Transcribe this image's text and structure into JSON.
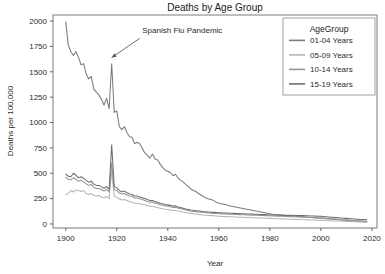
{
  "chart_data": {
    "type": "line",
    "title": "Deaths by Age Group",
    "xlabel": "Year",
    "ylabel": "Deaths per 100,000",
    "xlim": [
      1895,
      2022
    ],
    "ylim": [
      -40,
      2060
    ],
    "xticks": [
      1900,
      1920,
      1940,
      1960,
      1980,
      2000,
      2020
    ],
    "xtick_labels": [
      "1900",
      "1920",
      "1940",
      "1960",
      "1980",
      "2000",
      "2020"
    ],
    "yticks": [
      0,
      250,
      500,
      750,
      1000,
      1250,
      1500,
      1750,
      2000
    ],
    "ytick_labels": [
      "0",
      "250",
      "500",
      "750",
      "1000",
      "1250",
      "1500",
      "1750",
      "2000"
    ],
    "grid": false,
    "legend_position": "upper-right",
    "legend_title": "AgeGroup",
    "annotations": [
      {
        "text": "Spanish Flu Pandemic",
        "text_x": 1930,
        "text_y": 1880,
        "arrow_tip_x": 1918,
        "arrow_tip_y": 1640,
        "arrow_tail_x": 1929,
        "arrow_tail_y": 1830
      }
    ],
    "colors": {
      "01-04 Years": "#7b7b86",
      "05-09 Years": "#b5b5bb",
      "10-14 Years": "#949499",
      "15-19 Years": "#6d6d78",
      "axis": "#555555",
      "frame": "#6e6e6e",
      "background": "#ffffff"
    },
    "x": [
      1900,
      1901,
      1902,
      1903,
      1904,
      1905,
      1906,
      1907,
      1908,
      1909,
      1910,
      1911,
      1912,
      1913,
      1914,
      1915,
      1916,
      1917,
      1918,
      1919,
      1920,
      1921,
      1922,
      1923,
      1924,
      1925,
      1926,
      1927,
      1928,
      1929,
      1930,
      1931,
      1932,
      1933,
      1934,
      1935,
      1936,
      1937,
      1938,
      1939,
      1940,
      1941,
      1942,
      1943,
      1944,
      1945,
      1946,
      1947,
      1948,
      1949,
      1950,
      1951,
      1952,
      1953,
      1954,
      1955,
      1956,
      1957,
      1958,
      1959,
      1960,
      1961,
      1962,
      1963,
      1964,
      1965,
      1966,
      1967,
      1968,
      1969,
      1970,
      1971,
      1972,
      1973,
      1974,
      1975,
      1976,
      1977,
      1978,
      1979,
      1980,
      1981,
      1982,
      1983,
      1984,
      1985,
      1986,
      1987,
      1988,
      1989,
      1990,
      1991,
      1992,
      1993,
      1994,
      1995,
      1996,
      1997,
      1998,
      1999,
      2000,
      2001,
      2002,
      2003,
      2004,
      2005,
      2006,
      2007,
      2008,
      2009,
      2010,
      2011,
      2012,
      2013,
      2014,
      2015,
      2016,
      2017,
      2018
    ],
    "series": [
      {
        "name": "01-04 Years",
        "color": "#7b7b86",
        "values": [
          1990,
          1760,
          1700,
          1660,
          1700,
          1640,
          1570,
          1580,
          1480,
          1430,
          1455,
          1330,
          1300,
          1270,
          1230,
          1170,
          1240,
          1135,
          1580,
          1100,
          1115,
          960,
          930,
          960,
          900,
          860,
          855,
          790,
          805,
          790,
          745,
          700,
          675,
          650,
          690,
          640,
          630,
          590,
          555,
          530,
          520,
          505,
          475,
          490,
          455,
          430,
          415,
          390,
          370,
          345,
          330,
          320,
          300,
          285,
          270,
          255,
          245,
          240,
          230,
          215,
          205,
          200,
          195,
          190,
          180,
          175,
          170,
          165,
          160,
          155,
          150,
          145,
          140,
          135,
          130,
          125,
          120,
          115,
          110,
          105,
          100,
          96,
          93,
          90,
          88,
          86,
          84,
          82,
          80,
          78,
          76,
          74,
          72,
          70,
          68,
          66,
          64,
          62,
          60,
          58,
          56,
          54,
          52,
          50,
          48,
          46,
          44,
          42,
          40,
          38,
          36,
          34,
          32,
          30,
          28,
          27,
          26,
          25,
          24
        ]
      },
      {
        "name": "05-09 Years",
        "color": "#b5b5bb",
        "values": [
          290,
          300,
          330,
          315,
          335,
          330,
          320,
          330,
          300,
          290,
          300,
          280,
          275,
          280,
          265,
          255,
          270,
          250,
          520,
          270,
          265,
          245,
          235,
          240,
          230,
          220,
          215,
          205,
          205,
          200,
          195,
          190,
          180,
          175,
          175,
          168,
          162,
          155,
          150,
          145,
          142,
          138,
          132,
          135,
          128,
          122,
          118,
          112,
          108,
          104,
          100,
          97,
          94,
          91,
          88,
          86,
          84,
          82,
          80,
          78,
          76,
          74,
          73,
          72,
          71,
          70,
          69,
          68,
          67,
          66,
          65,
          64,
          63,
          62,
          61,
          60,
          59,
          58,
          57,
          56,
          55,
          54,
          53,
          52,
          51,
          50,
          49,
          48,
          47,
          46,
          45,
          44,
          43,
          42,
          41,
          40,
          39,
          38,
          37,
          36,
          35,
          34,
          33,
          32,
          31,
          30,
          29,
          28,
          27,
          26,
          25,
          24,
          23,
          22,
          21,
          20,
          19,
          18,
          17
        ]
      },
      {
        "name": "10-14 Years",
        "color": "#949499",
        "values": [
          460,
          440,
          435,
          455,
          440,
          420,
          430,
          415,
          395,
          380,
          390,
          360,
          350,
          350,
          340,
          325,
          340,
          315,
          600,
          340,
          330,
          305,
          295,
          300,
          285,
          275,
          270,
          255,
          255,
          248,
          240,
          232,
          222,
          215,
          214,
          205,
          200,
          190,
          184,
          178,
          175,
          170,
          163,
          165,
          156,
          150,
          144,
          138,
          133,
          128,
          124,
          121,
          118,
          115,
          112,
          110,
          108,
          106,
          104,
          102,
          100,
          99,
          98,
          97,
          96,
          95,
          94,
          93,
          92,
          91,
          90,
          89,
          88,
          87,
          86,
          85,
          84,
          83,
          82,
          81,
          80,
          79,
          78,
          77,
          76,
          75,
          74,
          73,
          72,
          71,
          70,
          69,
          68,
          67,
          66,
          65,
          64,
          63,
          62,
          61,
          60,
          58,
          56,
          54,
          52,
          50,
          48,
          46,
          44,
          42,
          40,
          38,
          36,
          34,
          32,
          30,
          29,
          28,
          27
        ]
      },
      {
        "name": "15-19 Years",
        "color": "#6d6d78",
        "values": [
          490,
          470,
          465,
          500,
          480,
          455,
          465,
          450,
          430,
          412,
          422,
          392,
          380,
          380,
          368,
          352,
          368,
          342,
          780,
          368,
          358,
          330,
          318,
          324,
          308,
          296,
          290,
          275,
          275,
          266,
          258,
          250,
          240,
          232,
          230,
          220,
          215,
          205,
          198,
          192,
          188,
          183,
          176,
          178,
          168,
          162,
          155,
          148,
          143,
          138,
          134,
          131,
          128,
          125,
          122,
          120,
          118,
          116,
          114,
          112,
          110,
          109,
          108,
          107,
          106,
          105,
          104,
          103,
          102,
          101,
          100,
          99,
          98,
          97,
          96,
          95,
          94,
          93,
          92,
          91,
          90,
          89,
          88,
          88,
          87,
          87,
          86,
          86,
          85,
          85,
          84,
          84,
          83,
          82,
          81,
          80,
          79,
          78,
          77,
          76,
          75,
          73,
          71,
          69,
          67,
          65,
          63,
          61,
          59,
          57,
          55,
          53,
          51,
          49,
          47,
          45,
          44,
          43,
          42
        ]
      }
    ]
  }
}
